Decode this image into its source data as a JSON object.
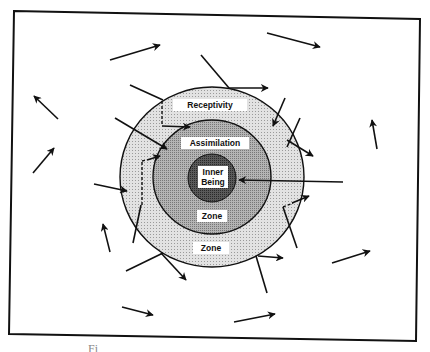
{
  "diagram": {
    "labels": {
      "receptivity": "Receptivity",
      "assimilation": "Assimilation",
      "inner_line1": "Inner",
      "inner_line2": "Being",
      "assimilation_zone": "Zone",
      "receptivity_zone": "Zone"
    },
    "rings": [
      {
        "name": "Receptivity Zone",
        "fill": "#d8d8d8"
      },
      {
        "name": "Assimilation Zone",
        "fill": "#a8a8a8"
      },
      {
        "name": "Inner Being",
        "fill": "#555555"
      }
    ],
    "caption_fragment": "Fi"
  }
}
